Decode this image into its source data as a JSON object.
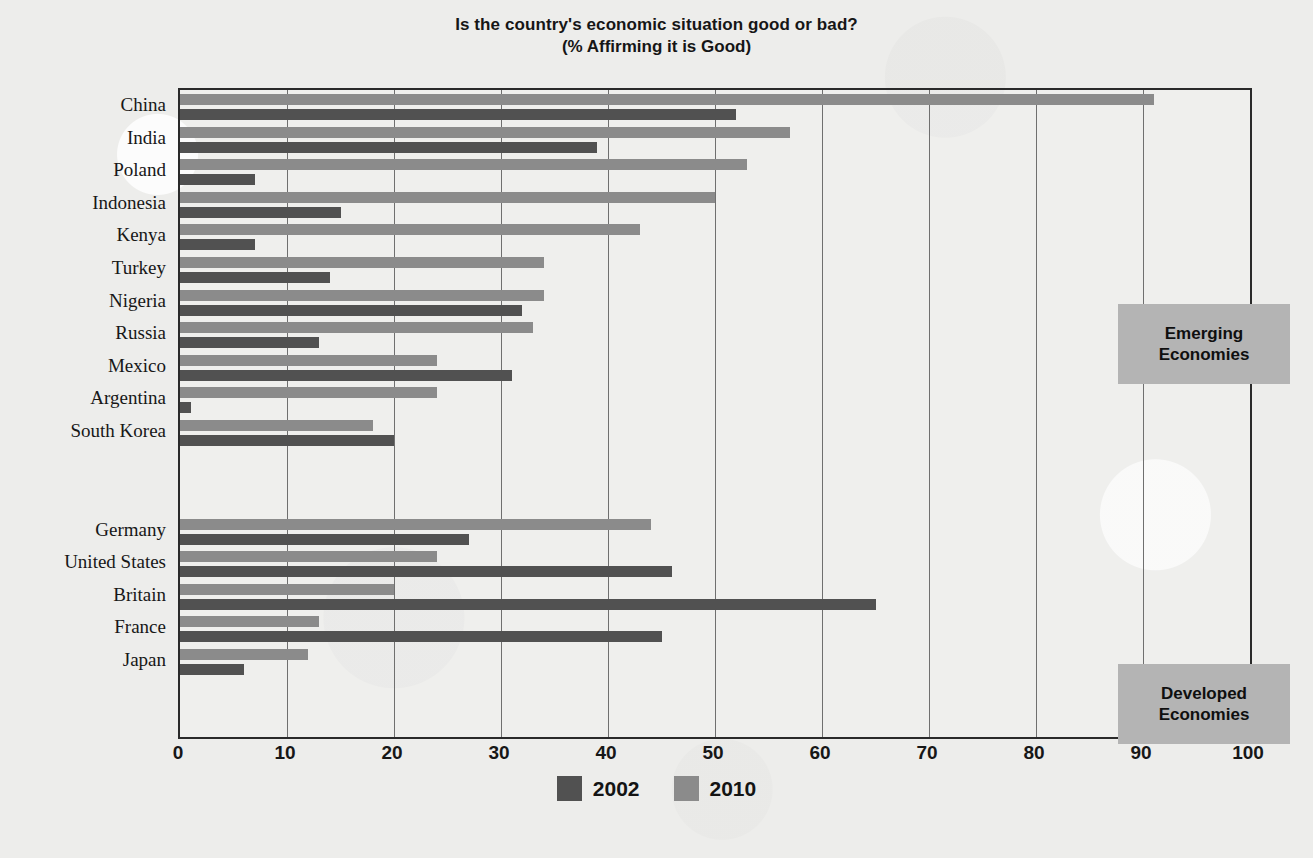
{
  "chart_data": {
    "type": "bar",
    "orientation": "horizontal",
    "title": "Is the country's economic situation good or bad?",
    "subtitle": "(% Affirming it is Good)",
    "xlabel": "",
    "ylabel": "",
    "xlim": [
      0,
      100
    ],
    "xticks": [
      0,
      10,
      20,
      30,
      40,
      50,
      60,
      70,
      80,
      90,
      100
    ],
    "grid": "vertical",
    "legend_position": "bottom-center",
    "categories": [
      "China",
      "India",
      "Poland",
      "Indonesia",
      "Kenya",
      "Turkey",
      "Nigeria",
      "Russia",
      "Mexico",
      "Argentina",
      "South Korea",
      "Germany",
      "United States",
      "Britain",
      "France",
      "Japan"
    ],
    "series": [
      {
        "name": "2002",
        "color": "#515151",
        "values": [
          52,
          39,
          7,
          15,
          7,
          14,
          32,
          13,
          31,
          1,
          20,
          27,
          46,
          65,
          45,
          6
        ]
      },
      {
        "name": "2010",
        "color": "#8b8b8b",
        "values": [
          91,
          57,
          53,
          50,
          43,
          34,
          34,
          33,
          24,
          24,
          18,
          44,
          24,
          20,
          13,
          12
        ]
      }
    ],
    "groups": [
      {
        "label": "Emerging Economies",
        "categories": [
          "China",
          "India",
          "Poland",
          "Indonesia",
          "Kenya",
          "Turkey",
          "Nigeria",
          "Russia",
          "Mexico",
          "Argentina",
          "South Korea"
        ]
      },
      {
        "label": "Developed Economies",
        "categories": [
          "Germany",
          "United States",
          "Britain",
          "France",
          "Japan"
        ]
      }
    ],
    "annotations": [
      {
        "text": "Emerging Economies",
        "kind": "box-label"
      },
      {
        "text": "Developed Economies",
        "kind": "box-label"
      }
    ]
  },
  "legend": {
    "items": [
      {
        "label": "2002",
        "color": "#515151"
      },
      {
        "label": "2010",
        "color": "#8b8b8b"
      }
    ]
  },
  "annotations": {
    "emerging": {
      "line1": "Emerging",
      "line2": "Economies"
    },
    "developed": {
      "line1": "Developed",
      "line2": "Economies"
    }
  },
  "colors": {
    "background": "#ededeb",
    "axis": "#2a2a2a",
    "gridline": "#6f6f6f",
    "series_2002": "#515151",
    "series_2010": "#8b8b8b",
    "annotation_box": "#b4b4b4",
    "text": "#161616"
  }
}
